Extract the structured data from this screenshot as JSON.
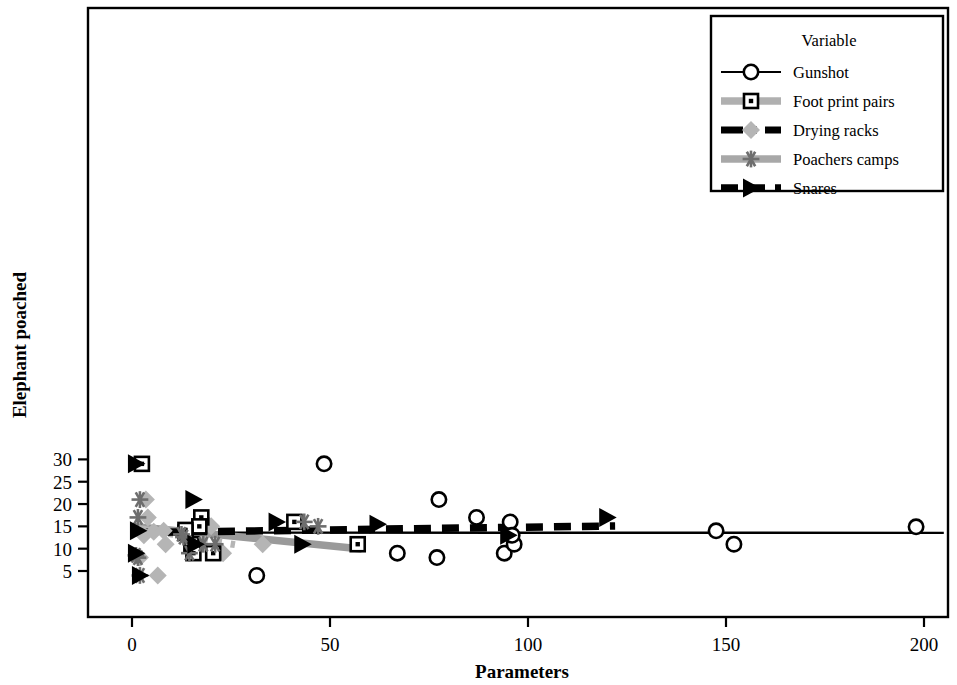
{
  "chart_data": {
    "type": "scatter",
    "title": "",
    "xlabel": "Parameters",
    "ylabel": "Elephant poached",
    "xlim": [
      -8,
      207
    ],
    "ylim": [
      3.0,
      30.2
    ],
    "xticks": [
      0,
      50,
      100,
      150,
      200
    ],
    "yticks": [
      5,
      10,
      15,
      20,
      25,
      30
    ],
    "grid": false,
    "legend_title": "Variable",
    "legend_position": "top-right",
    "series": [
      {
        "name": "Gunshot",
        "marker": "open-circle",
        "color": "#000000",
        "linestyle": "solid",
        "points": [
          [
            31.5,
            4.0
          ],
          [
            48.5,
            29.0
          ],
          [
            67.0,
            9.0
          ],
          [
            77.0,
            8.0
          ],
          [
            77.5,
            21.0
          ],
          [
            87.0,
            17.0
          ],
          [
            94.0,
            9.0
          ],
          [
            95.5,
            16.0
          ],
          [
            96.5,
            11.0
          ],
          [
            96.0,
            13.0
          ],
          [
            147.5,
            14.0
          ],
          [
            152.0,
            11.0
          ],
          [
            198.0,
            14.9
          ]
        ],
        "fit_line": [
          [
            0.5,
            13.6
          ],
          [
            205.0,
            13.55
          ]
        ]
      },
      {
        "name": "Foot print pairs",
        "marker": "open-square",
        "color": "#9a9a9a",
        "linestyle": "long-dash",
        "points": [
          [
            2.5,
            29.0
          ],
          [
            17.5,
            17.0
          ],
          [
            17.0,
            15.0
          ],
          [
            15.0,
            11.0
          ],
          [
            15.5,
            9.0
          ],
          [
            20.5,
            9.0
          ],
          [
            41.0,
            16.0
          ],
          [
            57.0,
            11.0
          ],
          [
            13.5,
            13.6
          ],
          [
            13.5,
            14.2
          ]
        ],
        "fit_line": [
          [
            0.5,
            15.0
          ],
          [
            58.0,
            9.95
          ]
        ]
      },
      {
        "name": "Drying racks",
        "marker": "diamond",
        "color": "#b5b5b5",
        "linestyle": "dash-dot",
        "points": [
          [
            3.5,
            21.0
          ],
          [
            4.0,
            17.0
          ],
          [
            8.5,
            11.0
          ],
          [
            18.5,
            16.0
          ],
          [
            20.0,
            15.0
          ],
          [
            23.0,
            9.0
          ],
          [
            33.0,
            11.0
          ],
          [
            3.0,
            13.0
          ],
          [
            5.5,
            13.8
          ],
          [
            6.5,
            4.0
          ],
          [
            2.0,
            8.0
          ],
          [
            8.0,
            14.0
          ]
        ],
        "fit_line": [
          [
            0.5,
            14.7
          ],
          [
            26.0,
            10.9
          ]
        ]
      },
      {
        "name": "Poachers camps",
        "marker": "asterisk",
        "color": "#6e6e6e",
        "linestyle": "solid-thick",
        "points": [
          [
            1.5,
            17.0
          ],
          [
            2.0,
            21.0
          ],
          [
            18.0,
            11.0
          ],
          [
            21.0,
            11.0
          ],
          [
            14.5,
            9.0
          ],
          [
            43.5,
            16.0
          ],
          [
            47.0,
            15.0
          ],
          [
            1.0,
            8.5
          ],
          [
            1.5,
            8.0
          ],
          [
            2.0,
            4.0
          ],
          [
            12.5,
            13.2
          ],
          [
            13.0,
            12.6
          ]
        ]
      },
      {
        "name": "Snares",
        "marker": "right-triangle",
        "color": "#000000",
        "linestyle": "dash",
        "points": [
          [
            1.0,
            29.0
          ],
          [
            15.5,
            21.0
          ],
          [
            36.5,
            16.0
          ],
          [
            62.0,
            15.5
          ],
          [
            43.0,
            11.0
          ],
          [
            16.0,
            11.0
          ],
          [
            95.0,
            13.0
          ],
          [
            120.0,
            17.0
          ],
          [
            1.5,
            14.0
          ],
          [
            1.0,
            9.0
          ],
          [
            2.0,
            4.0
          ]
        ],
        "fit_line": [
          [
            0.5,
            13.6
          ],
          [
            122.0,
            15.1
          ]
        ]
      }
    ]
  },
  "legend": {
    "title": "Variable",
    "entries": [
      {
        "label": "Gunshot",
        "marker": "open-circle",
        "style": "thin-solid-black"
      },
      {
        "label": "Foot print pairs",
        "marker": "open-square",
        "style": "thick-solid-gray"
      },
      {
        "label": "Drying racks",
        "marker": "diamond",
        "style": "dash-dot-black"
      },
      {
        "label": "Poachers camps",
        "marker": "asterisk",
        "style": "thick-solid-midgray"
      },
      {
        "label": "Snares",
        "marker": "right-triangle",
        "style": "dash-black"
      }
    ]
  },
  "axes": {
    "x_label": "Parameters",
    "y_label": "Elephant poached",
    "x_tick_labels": [
      "0",
      "50",
      "100",
      "150",
      "200"
    ],
    "y_tick_labels": [
      "5",
      "10",
      "15",
      "20",
      "25",
      "30"
    ]
  },
  "colors": {
    "axis": "#000000",
    "gray_light": "#b5b5b5",
    "gray_mid": "#9a9a9a",
    "gray_dark": "#6e6e6e",
    "black": "#000000",
    "background": "#ffffff"
  }
}
